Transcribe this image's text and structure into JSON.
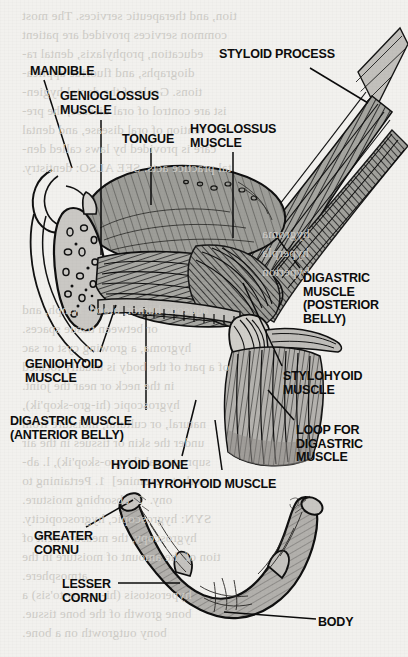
{
  "figure": {
    "paper_color": "#f2f1ee",
    "ink_color": "#111111",
    "tissue_fill": "#9b9b97",
    "bone_fill": "#b0aeaa"
  },
  "labels": [
    {
      "id": "mandible",
      "text": "MANDIBLE",
      "x": 30,
      "y": 65,
      "align": "left"
    },
    {
      "id": "genioglossus",
      "text": "GENIOGLOSSUS\nMUSCLE",
      "x": 60,
      "y": 90,
      "align": "left"
    },
    {
      "id": "tongue",
      "text": "TONGUE",
      "x": 122,
      "y": 133,
      "align": "left"
    },
    {
      "id": "hyoglossus",
      "text": "HYOGLOSSUS\nMUSCLE",
      "x": 190,
      "y": 123,
      "align": "left"
    },
    {
      "id": "styloid-process",
      "text": "STYLOID PROCESS",
      "x": 219,
      "y": 48,
      "align": "left"
    },
    {
      "id": "digastric-posterior",
      "text": "DIGASTRIC\nMUSCLE\n(POSTERIOR\nBELLY)",
      "x": 303,
      "y": 272,
      "align": "left"
    },
    {
      "id": "stylohyoid",
      "text": "STYLOHYOID\nMUSCLE",
      "x": 283,
      "y": 370,
      "align": "left"
    },
    {
      "id": "loop-digastric",
      "text": "LOOP FOR\nDIGASTRIC\nMUSCLE",
      "x": 296,
      "y": 424,
      "align": "left"
    },
    {
      "id": "geniohyoid",
      "text": "GENIOHYOID\nMUSCLE",
      "x": 25,
      "y": 358,
      "align": "left"
    },
    {
      "id": "digastric-anterior",
      "text": "DIGASTRIC MUSCLE\n(ANTERIOR BELLY)",
      "x": 10,
      "y": 415,
      "align": "left"
    },
    {
      "id": "hyoid-bone",
      "text": "HYOID BONE",
      "x": 111,
      "y": 459,
      "align": "left"
    },
    {
      "id": "thyrohyoid",
      "text": "THYROHYOID MUSCLE",
      "x": 140,
      "y": 478,
      "align": "left"
    },
    {
      "id": "greater-cornu",
      "text": "GREATER\nCORNU",
      "x": 34,
      "y": 530,
      "align": "left"
    },
    {
      "id": "lesser-cornu",
      "text": "LESSER\nCORNU",
      "x": 62,
      "y": 578,
      "align": "left"
    },
    {
      "id": "body",
      "text": "BODY",
      "x": 318,
      "y": 616,
      "align": "left"
    }
  ],
  "background_text": {
    "note": "faint show-through text from the reverse side of the printed page (mirrored)",
    "lines": [
      {
        "text": "tion, and therapeutic services. The most",
        "x": 22,
        "y": 6
      },
      {
        "text": "common services provided are patient",
        "x": 22,
        "y": 25
      },
      {
        "text": "education, prophylaxis, dental ra-",
        "x": 22,
        "y": 44
      },
      {
        "text": "diographs, and fluoride applica-",
        "x": 22,
        "y": 63
      },
      {
        "text": "tions. Goals of the dental hygien-",
        "x": 22,
        "y": 82
      },
      {
        "text": "ist are control of oral disease, the pre-",
        "x": 22,
        "y": 101
      },
      {
        "text": "vention of oral disease, and dental",
        "x": 22,
        "y": 120
      },
      {
        "text": "care is provided by laws called den-",
        "x": 22,
        "y": 139
      },
      {
        "text": "tal practice acts. SEE ALSO: dentistry.",
        "x": 22,
        "y": 158
      },
      {
        "text": "hygroma",
        "x": 262,
        "y": 224
      },
      {
        "text": "hyperpla",
        "x": 262,
        "y": 243
      },
      {
        "text": "hyperton",
        "x": 262,
        "y": 262
      },
      {
        "text": "aqueous humor, blood, lymph, and",
        "x": 22,
        "y": 300
      },
      {
        "text": "or between tissue spaces.",
        "x": 22,
        "y": 319
      },
      {
        "text": "hygroma, a growing cyst or sac",
        "x": 22,
        "y": 338
      },
      {
        "text": "of a part of the body is usually located",
        "x": 22,
        "y": 357
      },
      {
        "text": "in the neck or near the joint.",
        "x": 22,
        "y": 376
      },
      {
        "text": "hygroscopic (hi-gro-skop'ik),",
        "x": 22,
        "y": 395
      },
      {
        "text": "natural, or cultural, moisture from",
        "x": 22,
        "y": 414
      },
      {
        "text": "under the skin or tissues in the air",
        "x": 22,
        "y": 433
      },
      {
        "text": "suprasternal (hi-gro-skop'ik), l. ab-",
        "x": 22,
        "y": 452
      },
      {
        "text": "sorb, to examine]  1. Pertaining to",
        "x": 22,
        "y": 471
      },
      {
        "text": "ony.  2. absorbing moisture.",
        "x": 22,
        "y": 490
      },
      {
        "text": "SYN: hygroscopic, hygroscopicity.",
        "x": 22,
        "y": 509
      },
      {
        "text": "hygroscopy, the measurement of",
        "x": 22,
        "y": 528
      },
      {
        "text": "tion of the amount of moisture in the",
        "x": 22,
        "y": 547
      },
      {
        "text": "atmosphere.",
        "x": 22,
        "y": 566
      },
      {
        "text": "hyperostosis (hi-per-os-to'sis) a",
        "x": 22,
        "y": 585
      },
      {
        "text": "bone growth of the bone tissue.",
        "x": 22,
        "y": 604
      },
      {
        "text": "bony outgrowth on a bone.",
        "x": 22,
        "y": 623
      }
    ]
  },
  "leader_lines": [
    {
      "id": "mandible-leader",
      "x1": 44,
      "y1": 80,
      "x2": 72,
      "y2": 168
    },
    {
      "id": "genioglossus-leader",
      "x1": 101,
      "y1": 120,
      "x2": 101,
      "y2": 255
    },
    {
      "id": "tongue-leader",
      "x1": 151,
      "y1": 148,
      "x2": 151,
      "y2": 205
    },
    {
      "id": "hyoglossus-leader",
      "x1": 233,
      "y1": 152,
      "x2": 233,
      "y2": 238
    },
    {
      "id": "styloid-leader",
      "x1": 310,
      "y1": 68,
      "x2": 368,
      "y2": 103
    },
    {
      "id": "digastric-post-leader",
      "x1": 300,
      "y1": 268,
      "x2": 273,
      "y2": 232
    },
    {
      "id": "stylohyoid-leader",
      "x1": 282,
      "y1": 366,
      "x2": 243,
      "y2": 283
    },
    {
      "id": "loop-leader",
      "x1": 294,
      "y1": 420,
      "x2": 268,
      "y2": 390
    },
    {
      "id": "geniohyoid-leader",
      "x1": 100,
      "y1": 352,
      "x2": 116,
      "y2": 305
    },
    {
      "id": "digastric-ant-leader",
      "x1": 146,
      "y1": 410,
      "x2": 146,
      "y2": 310
    },
    {
      "id": "hyoid-bone-leader",
      "x1": 182,
      "y1": 456,
      "x2": 196,
      "y2": 400
    },
    {
      "id": "thyrohyoid-leader",
      "x1": 222,
      "y1": 470,
      "x2": 215,
      "y2": 420
    },
    {
      "id": "greater-cornu-leader",
      "x1": 86,
      "y1": 527,
      "x2": 133,
      "y2": 500
    },
    {
      "id": "lesser-cornu-leader",
      "x1": 118,
      "y1": 583,
      "x2": 180,
      "y2": 583
    },
    {
      "id": "body-leader",
      "x1": 316,
      "y1": 619,
      "x2": 224,
      "y2": 612
    }
  ]
}
